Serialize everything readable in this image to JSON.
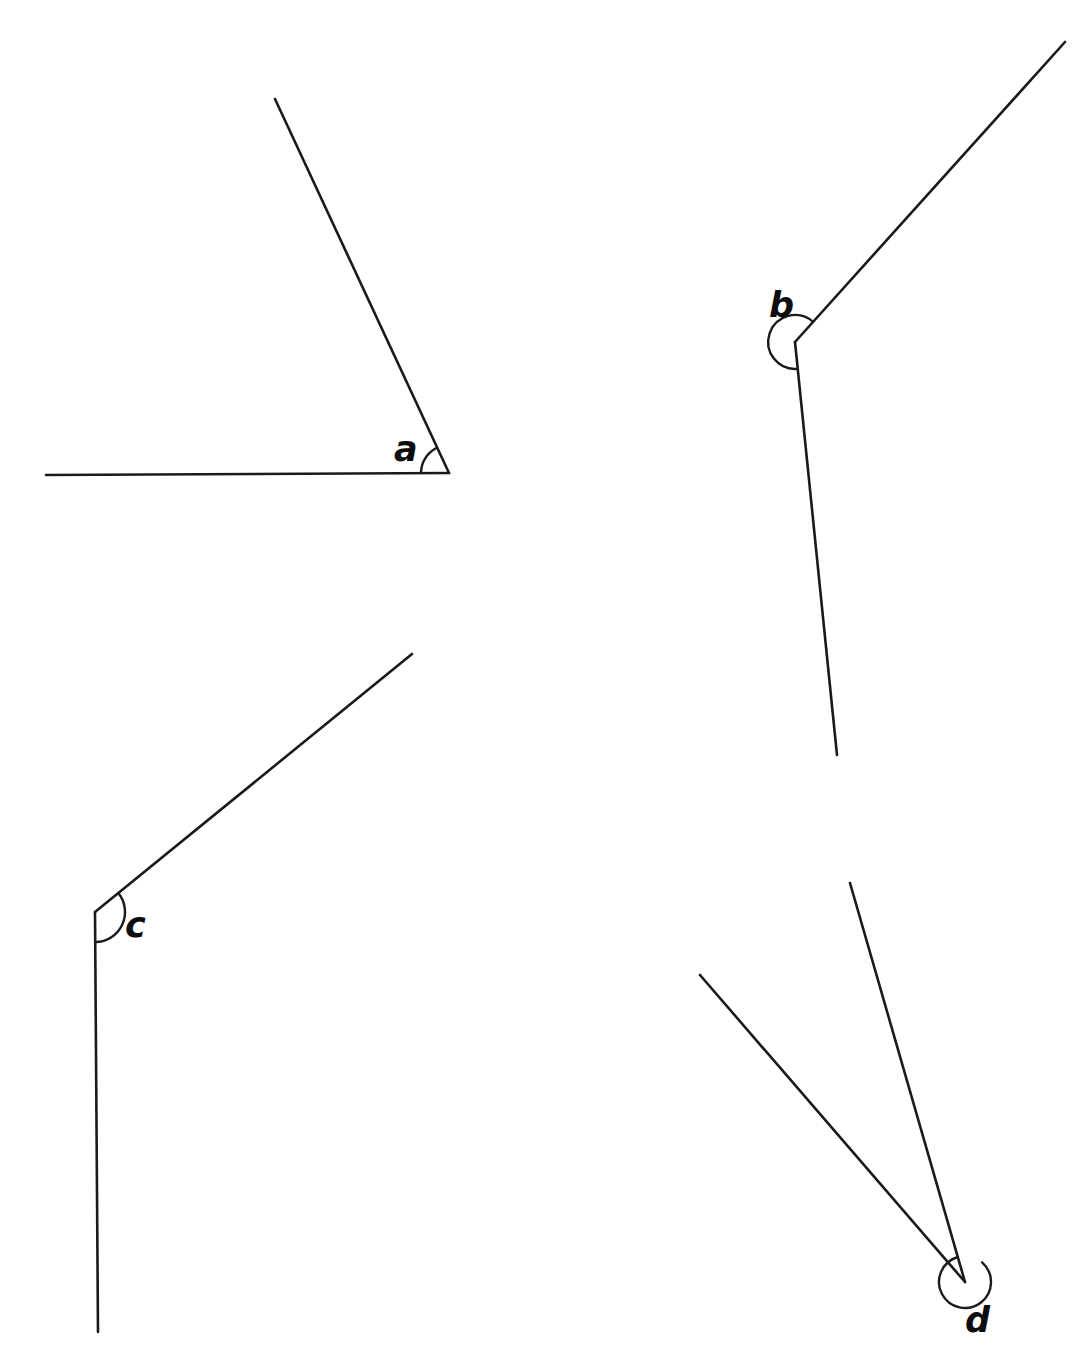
{
  "page": {
    "width": 1081,
    "height": 1352,
    "background_color": "#ffffff",
    "ink_color": "#1a1a1a",
    "label_color": "#0d0d0d"
  },
  "figures": [
    {
      "id": "figure-a",
      "label": "a",
      "label_position": {
        "x": 394,
        "y": 432
      },
      "vertex": {
        "x": 449,
        "y": 473
      },
      "rays": [
        {
          "name": "horizontal-left-ray",
          "x1": 449,
          "y1": 473,
          "x2": 46,
          "y2": 475
        },
        {
          "name": "upper-left-slant-ray",
          "x1": 449,
          "y1": 473,
          "x2": 275,
          "y2": 99
        }
      ],
      "arc": {
        "type": "single",
        "radius": 28,
        "start_angle_deg": 180,
        "end_angle_deg": 115,
        "sweep": "acute-interior"
      },
      "angle_type": "acute",
      "approx_measure_deg": 65
    },
    {
      "id": "figure-b",
      "label": "b",
      "label_position": {
        "x": 769,
        "y": 288
      },
      "vertex": {
        "x": 795,
        "y": 342
      },
      "rays": [
        {
          "name": "upper-right-slant-ray",
          "x1": 795,
          "y1": 342,
          "x2": 1065,
          "y2": 42
        },
        {
          "name": "lower-slant-ray",
          "x1": 795,
          "y1": 342,
          "x2": 837,
          "y2": 755
        }
      ],
      "arc": {
        "type": "reflex",
        "radius": 27,
        "start_angle_deg": 84,
        "end_angle_deg": 312,
        "sweep": "reflex-exterior-left"
      },
      "angle_type": "reflex",
      "approx_measure_deg": 228
    },
    {
      "id": "figure-c",
      "label": "c",
      "label_position": {
        "x": 125,
        "y": 908
      },
      "vertex": {
        "x": 95,
        "y": 912
      },
      "rays": [
        {
          "name": "upper-right-slant-ray",
          "x1": 95,
          "y1": 912,
          "x2": 412,
          "y2": 654
        },
        {
          "name": "downward-ray",
          "x1": 95,
          "y1": 912,
          "x2": 98,
          "y2": 1332
        }
      ],
      "arc": {
        "type": "single",
        "radius": 30,
        "start_angle_deg": 39,
        "end_angle_deg": -89,
        "sweep": "obtuse-interior-right"
      },
      "angle_type": "obtuse",
      "approx_measure_deg": 129
    },
    {
      "id": "figure-d",
      "label": "d",
      "label_position": {
        "x": 965,
        "y": 1303
      },
      "vertex": {
        "x": 965,
        "y": 1282
      },
      "rays": [
        {
          "name": "upper-left-steep-ray",
          "x1": 965,
          "y1": 1282,
          "x2": 850,
          "y2": 883
        },
        {
          "name": "upper-left-shallow-ray",
          "x1": 965,
          "y1": 1282,
          "x2": 700,
          "y2": 975
        }
      ],
      "arc": {
        "type": "reflex",
        "radius": 26,
        "start_angle_deg": 106,
        "end_angle_deg": 49,
        "sweep": "reflex-near-full-circle"
      },
      "angle_type": "reflex",
      "approx_measure_deg": 303
    }
  ]
}
